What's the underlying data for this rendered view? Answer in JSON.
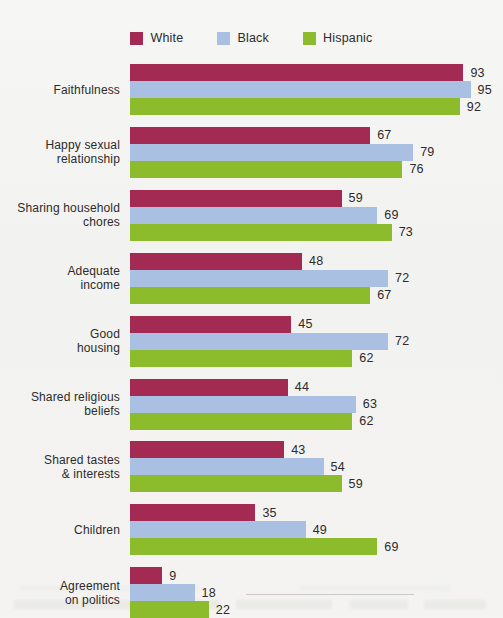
{
  "legend": {
    "items": [
      {
        "label": "White",
        "color": "#a32a52",
        "icon": "legend-swatch-white"
      },
      {
        "label": "Black",
        "color": "#a9c0e2",
        "icon": "legend-swatch-black"
      },
      {
        "label": "Hispanic",
        "color": "#8cbc2b",
        "icon": "legend-swatch-hispanic"
      }
    ]
  },
  "chart_data": {
    "type": "bar",
    "orientation": "horizontal",
    "title": "",
    "subtitle": "",
    "xlabel": "",
    "ylabel": "",
    "xlim": [
      0,
      100
    ],
    "grid": false,
    "legend_position": "top-center",
    "value_labels": true,
    "categories": [
      "Faithfulness",
      "Happy sexual relationship",
      "Sharing household chores",
      "Adequate income",
      "Good housing",
      "Shared religious beliefs",
      "Shared tastes & interests",
      "Children",
      "Agreement on politics"
    ],
    "category_lines": [
      [
        "Faithfulness"
      ],
      [
        "Happy sexual",
        "relationship"
      ],
      [
        "Sharing household",
        "chores"
      ],
      [
        "Adequate",
        "income"
      ],
      [
        "Good",
        "housing"
      ],
      [
        "Shared religious",
        "beliefs"
      ],
      [
        "Shared tastes",
        "& interests"
      ],
      [
        "Children"
      ],
      [
        "Agreement",
        "on politics"
      ]
    ],
    "series": [
      {
        "name": "White",
        "color": "#a32a52",
        "values": [
          93,
          67,
          59,
          48,
          45,
          44,
          43,
          35,
          9
        ]
      },
      {
        "name": "Black",
        "color": "#a9c0e2",
        "values": [
          95,
          79,
          69,
          72,
          72,
          63,
          54,
          49,
          18
        ]
      },
      {
        "name": "Hispanic",
        "color": "#8cbc2b",
        "values": [
          92,
          76,
          73,
          67,
          62,
          62,
          59,
          69,
          22
        ]
      }
    ]
  }
}
